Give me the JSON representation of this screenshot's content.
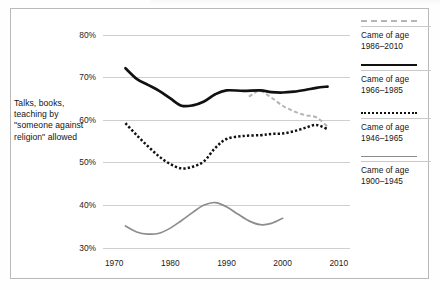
{
  "chart_data": {
    "type": "line",
    "title": "",
    "xlabel": "",
    "ylabel": "Talks, books, teaching by \"someone against religion\" allowed",
    "xlim": [
      1968,
      2012
    ],
    "ylim": [
      29,
      82
    ],
    "grid": true,
    "legend_position": "right",
    "x_ticks": [
      "1970",
      "1980",
      "1990",
      "2000",
      "2010"
    ],
    "x_tick_values": [
      1970,
      1980,
      1990,
      2000,
      2010
    ],
    "y_ticks": [
      "30%",
      "40%",
      "50%",
      "60%",
      "70%",
      "80%"
    ],
    "y_tick_values": [
      30,
      40,
      50,
      60,
      70,
      80
    ],
    "series": [
      {
        "name": "Came of age 1986-2010",
        "legend_label_line1": "Came of age",
        "legend_label_line2": "1986–2010",
        "style": "dashed",
        "color": "#b5b5b5",
        "x": [
          1994,
          1995,
          1996,
          1998,
          2000,
          2002,
          2004,
          2006,
          2008
        ],
        "y": [
          65.4,
          66.3,
          66.8,
          65.2,
          63.3,
          62.0,
          61.1,
          60.6,
          58.4
        ]
      },
      {
        "name": "Came of age 1966-1985",
        "legend_label_line1": "Came of age",
        "legend_label_line2": "1966–1985",
        "style": "solid-thick",
        "color": "#111111",
        "x": [
          1972,
          1974,
          1976,
          1978,
          1980,
          1982,
          1984,
          1986,
          1988,
          1990,
          1993,
          1996,
          1998,
          2000,
          2002,
          2004,
          2006,
          2008
        ],
        "y": [
          72.1,
          69.6,
          68.2,
          66.8,
          65.0,
          63.3,
          63.4,
          64.3,
          66.0,
          66.9,
          66.8,
          66.9,
          66.5,
          66.4,
          66.6,
          67.0,
          67.5,
          67.8
        ]
      },
      {
        "name": "Came of age 1946-1965",
        "legend_label_line1": "Came of age",
        "legend_label_line2": "1946–1965",
        "style": "dotted",
        "color": "#111111",
        "x": [
          1972,
          1974,
          1976,
          1978,
          1980,
          1982,
          1984,
          1986,
          1988,
          1990,
          1993,
          1996,
          1998,
          2000,
          2002,
          2004,
          2006,
          2008
        ],
        "y": [
          59.2,
          56.4,
          53.8,
          51.4,
          49.6,
          48.6,
          49.0,
          50.3,
          53.4,
          55.5,
          56.2,
          56.4,
          56.7,
          56.8,
          57.3,
          58.1,
          58.8,
          57.8
        ]
      },
      {
        "name": "Came of age 1900-1945",
        "legend_label_line1": "Came of age",
        "legend_label_line2": "1900–1945",
        "style": "solid-thin",
        "color": "#8c8c8c",
        "x": [
          1972,
          1974,
          1976,
          1978,
          1980,
          1982,
          1984,
          1986,
          1988,
          1990,
          1992,
          1994,
          1996,
          1998,
          2000
        ],
        "y": [
          35.1,
          33.7,
          33.2,
          33.4,
          34.6,
          36.4,
          38.3,
          40.0,
          40.6,
          39.6,
          37.9,
          36.3,
          35.4,
          35.7,
          36.9
        ]
      }
    ]
  }
}
